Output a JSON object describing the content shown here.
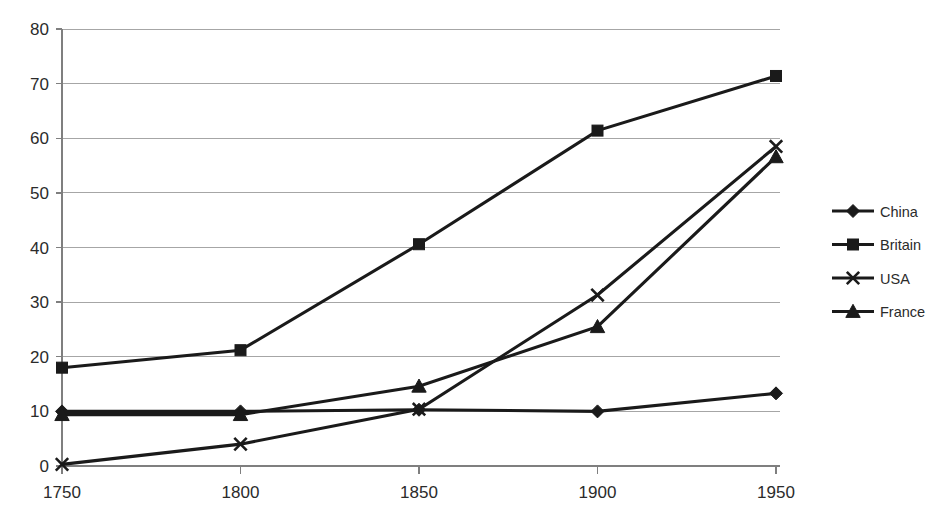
{
  "chart_data": {
    "type": "line",
    "title": "",
    "subtitle": "",
    "xlabel": "",
    "ylabel": "",
    "categories": [
      "1750",
      "1800",
      "1850",
      "1900",
      "1950"
    ],
    "x": [
      1750,
      1800,
      1850,
      1900,
      1950
    ],
    "xlim": [
      1750,
      1950
    ],
    "ylim": [
      0,
      80
    ],
    "y_ticks": [
      "0",
      "10",
      "20",
      "30",
      "40",
      "50",
      "60",
      "70",
      "80"
    ],
    "y_tick_values": [
      0,
      10,
      20,
      30,
      40,
      50,
      60,
      70,
      80
    ],
    "x_ticks": [
      "1750",
      "1800",
      "1850",
      "1900",
      "1950"
    ],
    "grid": "horizontal",
    "legend_position": "right",
    "series": [
      {
        "name": "China",
        "marker": "diamond",
        "color": "#1a1a1a",
        "values": [
          10.0,
          10.0,
          10.3,
          10.0,
          13.3
        ]
      },
      {
        "name": "Britain",
        "marker": "square",
        "color": "#1a1a1a",
        "values": [
          18.0,
          21.2,
          40.6,
          61.4,
          71.4
        ]
      },
      {
        "name": "USA",
        "marker": "cross",
        "color": "#1a1a1a",
        "values": [
          0.3,
          4.0,
          10.4,
          31.3,
          58.5
        ]
      },
      {
        "name": "France",
        "marker": "triangle",
        "color": "#1a1a1a",
        "values": [
          9.4,
          9.4,
          14.6,
          25.5,
          56.6
        ]
      }
    ]
  },
  "legend": {
    "entries": [
      {
        "label": "China",
        "marker": "diamond"
      },
      {
        "label": "Britain",
        "marker": "square"
      },
      {
        "label": "USA",
        "marker": "cross"
      },
      {
        "label": "France",
        "marker": "triangle"
      }
    ]
  },
  "colors": {
    "background": "#ffffff",
    "series": "#1a1a1a",
    "gridline": "#a6a6a6",
    "axis": "#7f7f7f",
    "text": "#2b2b2b"
  }
}
